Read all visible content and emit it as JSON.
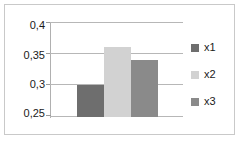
{
  "chart_data": {
    "type": "bar",
    "title": "",
    "subtitle": "",
    "xlabel": "",
    "ylabel": "",
    "categories": [
      "x1",
      "x2",
      "x3"
    ],
    "values": [
      0.3,
      0.36,
      0.34
    ],
    "ylim": [
      0.25,
      0.4
    ],
    "ytick_labels": [
      "0,4",
      "0,35",
      "0,3",
      "0,25"
    ],
    "ytick_values": [
      0.4,
      0.35,
      0.3,
      0.25
    ],
    "xtick_labels": [],
    "grid": true,
    "legend_position": "right",
    "series": [
      {
        "name": "x1",
        "value": 0.3,
        "color": "#6e6e6e"
      },
      {
        "name": "x2",
        "value": 0.36,
        "color": "#d2d2d2"
      },
      {
        "name": "x3",
        "value": 0.34,
        "color": "#8a8a8a"
      }
    ],
    "colors": {
      "x1": "#6e6e6e",
      "x2": "#d2d2d2",
      "x3": "#8a8a8a",
      "gridline": "#b7b7b7",
      "axis": "#b0b0b0",
      "border": "#c9c9c9",
      "background": "#ffffff",
      "text": "#1a1a1a"
    }
  },
  "legend": {
    "items": [
      {
        "label": "x1"
      },
      {
        "label": "x2"
      },
      {
        "label": "x3"
      }
    ]
  }
}
